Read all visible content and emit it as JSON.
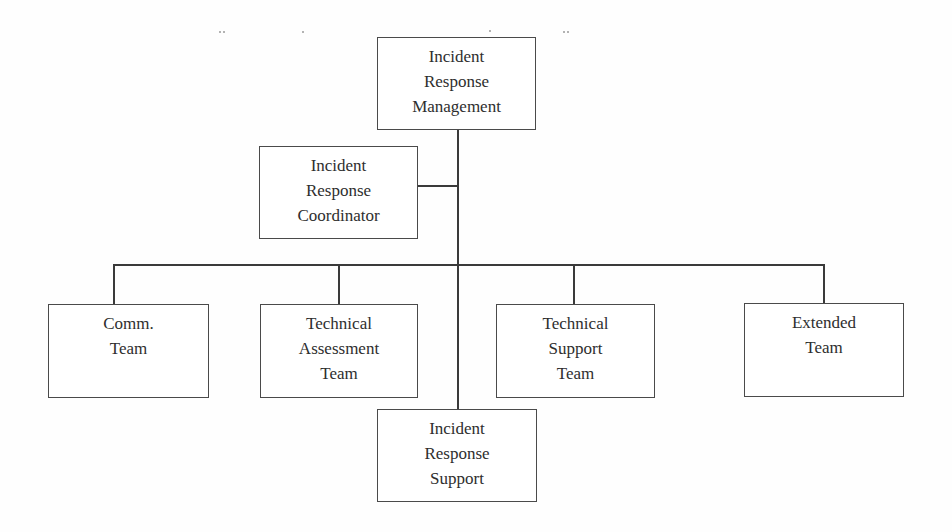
{
  "diagram": {
    "type": "org-chart",
    "title": "",
    "nodes": {
      "management": {
        "lines": [
          "Incident",
          "Response",
          "Management"
        ]
      },
      "coordinator": {
        "lines": [
          "Incident",
          "Response",
          "Coordinator"
        ]
      },
      "comm_team": {
        "lines": [
          "Comm.",
          "Team"
        ]
      },
      "technical_assessment_team": {
        "lines": [
          "Technical",
          "Assessment",
          "Team"
        ]
      },
      "technical_support_team": {
        "lines": [
          "Technical",
          "Support",
          "Team"
        ]
      },
      "extended_team": {
        "lines": [
          "Extended",
          "Team"
        ]
      },
      "support": {
        "lines": [
          "Incident",
          "Response",
          "Support"
        ]
      }
    },
    "edges": [
      {
        "from": "management",
        "to": "coordinator"
      },
      {
        "from": "management",
        "to": "comm_team"
      },
      {
        "from": "management",
        "to": "technical_assessment_team"
      },
      {
        "from": "management",
        "to": "technical_support_team"
      },
      {
        "from": "management",
        "to": "extended_team"
      },
      {
        "from": "management",
        "to": "support"
      }
    ]
  },
  "colors": {
    "line": "#3a3a3a",
    "box_border": "#4a4a4a",
    "text": "#2e2e2e",
    "background": "#fefefe"
  }
}
